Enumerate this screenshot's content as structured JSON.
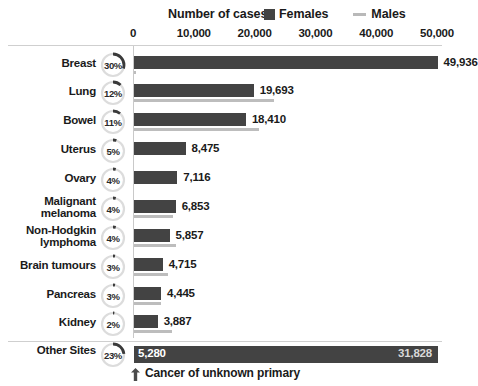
{
  "header": {
    "axis_title": "Number of cases",
    "legend": [
      {
        "label": "Females",
        "marker": "square-swatch",
        "color": "#434343"
      },
      {
        "label": "Males",
        "marker": "line-swatch",
        "color": "#bdbdbd"
      }
    ]
  },
  "footnote": {
    "icon": "arrow-up-icon",
    "text": "Cancer of unknown primary"
  },
  "chart_data": {
    "type": "bar",
    "orientation": "horizontal",
    "title": "Number of cases",
    "xlabel": "Number of cases",
    "ylabel": "",
    "xlim": [
      0,
      50000
    ],
    "xticks": [
      0,
      10000,
      20000,
      30000,
      40000,
      50000
    ],
    "xtick_labels": [
      "0",
      "10,000",
      "20,000",
      "30,000",
      "40,000",
      "50,000"
    ],
    "grid": false,
    "legend_position": "top-right",
    "categories": [
      "Breast",
      "Lung",
      "Bowel",
      "Uterus",
      "Ovary",
      "Malignant melanoma",
      "Non-Hodgkin lymphoma",
      "Brain tumours",
      "Pancreas",
      "Kidney",
      "Other Sites"
    ],
    "series": [
      {
        "name": "Females",
        "color": "#434343",
        "values": [
          49936,
          19693,
          18410,
          8475,
          7116,
          6853,
          5857,
          4715,
          4445,
          3887,
          31828
        ]
      },
      {
        "name": "Males",
        "color": "#bdbdbd",
        "values": [
          250,
          23000,
          20500,
          null,
          null,
          6400,
          6900,
          5650,
          4480,
          6250,
          null
        ]
      }
    ],
    "bar_value_labels": [
      "49,936",
      "19,693",
      "18,410",
      "8,475",
      "7,116",
      "6,853",
      "5,857",
      "4,715",
      "4,445",
      "3,887",
      "31,828"
    ],
    "percent_labels": [
      "30%",
      "12%",
      "11%",
      "5%",
      "4%",
      "4%",
      "4%",
      "3%",
      "3%",
      "2%",
      "23%"
    ],
    "percent_values": [
      30,
      12,
      11,
      5,
      4,
      4,
      4,
      3,
      3,
      2,
      23
    ],
    "other_sites_left_label": "5,280",
    "other_sites_right_label": "31,828"
  },
  "rows": [
    {
      "name": "Breast",
      "label_lines": [
        "Breast"
      ],
      "pct": "30%",
      "pct_value": 30,
      "value_label": "49,936",
      "female": 49936,
      "male": 250,
      "top": 56
    },
    {
      "name": "Lung",
      "label_lines": [
        "Lung"
      ],
      "pct": "12%",
      "pct_value": 12,
      "value_label": "19,693",
      "female": 19693,
      "male": 23000,
      "top": 84
    },
    {
      "name": "Bowel",
      "label_lines": [
        "Bowel"
      ],
      "pct": "11%",
      "pct_value": 11,
      "value_label": "18,410",
      "female": 18410,
      "male": 20500,
      "top": 113
    },
    {
      "name": "Uterus",
      "label_lines": [
        "Uterus"
      ],
      "pct": "5%",
      "pct_value": 5,
      "value_label": "8,475",
      "female": 8475,
      "male": null,
      "top": 142
    },
    {
      "name": "Ovary",
      "label_lines": [
        "Ovary"
      ],
      "pct": "4%",
      "pct_value": 4,
      "value_label": "7,116",
      "female": 7116,
      "male": null,
      "top": 171
    },
    {
      "name": "Malignant melanoma",
      "label_lines": [
        "Malignant",
        "melanoma"
      ],
      "pct": "4%",
      "pct_value": 4,
      "value_label": "6,853",
      "female": 6853,
      "male": 6400,
      "top": 200
    },
    {
      "name": "Non-Hodgkin lymphoma",
      "label_lines": [
        "Non-Hodgkin",
        "lymphoma"
      ],
      "pct": "4%",
      "pct_value": 4,
      "value_label": "5,857",
      "female": 5857,
      "male": 6900,
      "top": 229
    },
    {
      "name": "Brain tumours",
      "label_lines": [
        "Brain tumours"
      ],
      "pct": "3%",
      "pct_value": 3,
      "value_label": "4,715",
      "female": 4715,
      "male": 5650,
      "top": 258
    },
    {
      "name": "Pancreas",
      "label_lines": [
        "Pancreas"
      ],
      "pct": "3%",
      "pct_value": 3,
      "value_label": "4,445",
      "female": 4445,
      "male": 4480,
      "top": 287
    },
    {
      "name": "Kidney",
      "label_lines": [
        "Kidney"
      ],
      "pct": "2%",
      "pct_value": 2,
      "value_label": "3,887",
      "female": 3887,
      "male": 6250,
      "top": 315
    }
  ],
  "other_row": {
    "name": "Other Sites",
    "label": "Other Sites",
    "pct": "23%",
    "pct_value": 23,
    "left_value": "5,280",
    "right_value": "31,828"
  }
}
